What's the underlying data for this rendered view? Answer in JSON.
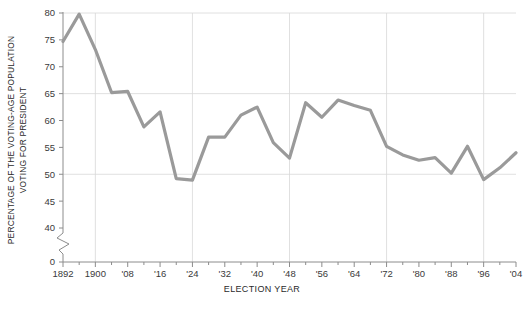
{
  "chart_data": {
    "type": "line",
    "title": "",
    "subtitle": "",
    "xlabel": "ELECTION YEAR",
    "ylabel": "PERCENTAGE OF THE VOTING-AGE POPULATION VOTING FOR PRESIDENT",
    "ylabel_line1": "PERCENTAGE OF THE VOTING-AGE POPULATION",
    "ylabel_line2": "VOTING FOR PRESIDENT",
    "ylim": [
      40,
      80
    ],
    "y_axis_break": true,
    "y_break_baseline": 0,
    "ytick_labels": [
      "80",
      "75",
      "70",
      "65",
      "60",
      "55",
      "50",
      "45",
      "40",
      "0"
    ],
    "yticks": [
      80,
      75,
      70,
      65,
      60,
      55,
      50,
      45,
      40,
      0
    ],
    "gridlines_y": [
      80,
      65,
      50
    ],
    "gridlines_x": [
      1900,
      1924,
      1948,
      1972,
      1996
    ],
    "xtick_labels": [
      "1892",
      "1900",
      "'08",
      "'16",
      "'24",
      "'32",
      "'40",
      "'48",
      "'56",
      "'64",
      "'72",
      "'80",
      "'88",
      "'96",
      "'04"
    ],
    "xticks": [
      1892,
      1900,
      1908,
      1916,
      1924,
      1932,
      1940,
      1948,
      1956,
      1964,
      1972,
      1980,
      1988,
      1996,
      2004
    ],
    "xlim": [
      1892,
      2004
    ],
    "grid": true,
    "legend": "none",
    "line_color": "#9a9a9a",
    "grid_color": "#d8d8d8",
    "axis_color": "#8c8c8c",
    "x": [
      1892,
      1896,
      1900,
      1904,
      1908,
      1912,
      1916,
      1920,
      1924,
      1928,
      1932,
      1936,
      1940,
      1944,
      1948,
      1952,
      1956,
      1960,
      1964,
      1968,
      1972,
      1976,
      1980,
      1984,
      1988,
      1992,
      1996,
      2000,
      2004
    ],
    "values": [
      74.7,
      79.8,
      73.2,
      65.2,
      65.4,
      58.8,
      61.6,
      49.2,
      48.9,
      56.9,
      56.9,
      61.0,
      62.5,
      55.9,
      53.0,
      63.3,
      60.6,
      63.8,
      62.8,
      61.9,
      55.2,
      53.6,
      52.6,
      53.1,
      50.2,
      55.2,
      49.0,
      51.2,
      54.0
    ],
    "series": [
      {
        "name": "Voter turnout",
        "values": [
          74.7,
          79.8,
          73.2,
          65.2,
          65.4,
          58.8,
          61.6,
          49.2,
          48.9,
          56.9,
          56.9,
          61.0,
          62.5,
          55.9,
          53.0,
          63.3,
          60.6,
          63.8,
          62.8,
          61.9,
          55.2,
          53.6,
          52.6,
          53.1,
          50.2,
          55.2,
          49.0,
          51.2,
          54.0
        ]
      }
    ]
  }
}
